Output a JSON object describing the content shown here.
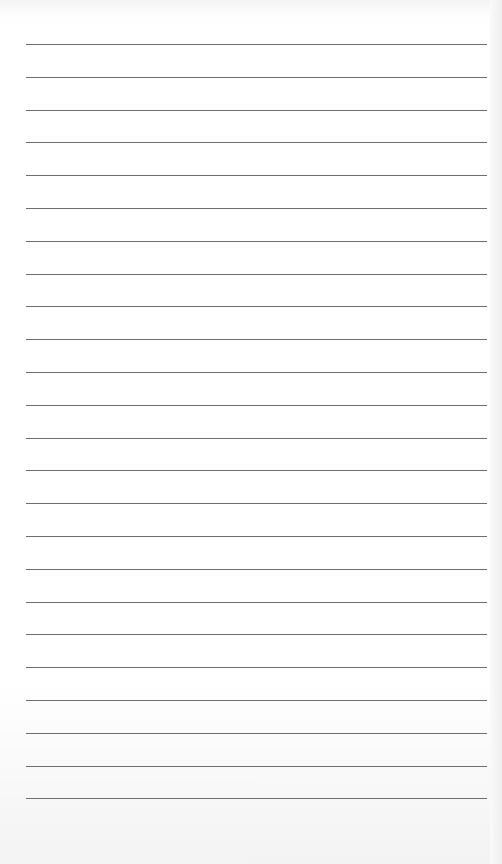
{
  "document": {
    "type": "lined-paper",
    "line_count": 24,
    "first_line_y": 44,
    "line_spacing": 32.8,
    "line_left": 26,
    "line_width": 461,
    "line_color": "#6e6e6e",
    "paper_color": "#ffffff"
  }
}
